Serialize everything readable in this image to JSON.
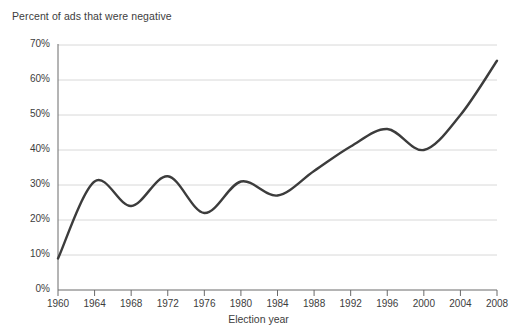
{
  "chart_data": {
    "type": "line",
    "title": "Percent of ads that were negative",
    "xlabel": "Election year",
    "ylabel": "",
    "categories": [
      1960,
      1964,
      1968,
      1972,
      1976,
      1980,
      1984,
      1988,
      1992,
      1996,
      2000,
      2004,
      2008
    ],
    "x": [
      1960,
      1964,
      1968,
      1972,
      1976,
      1980,
      1984,
      1988,
      1992,
      1996,
      2000,
      2004,
      2008
    ],
    "values": [
      9,
      31,
      24,
      32.5,
      22,
      31,
      27,
      34,
      41,
      46,
      40,
      50,
      65.5
    ],
    "series": [
      {
        "name": "Percent of ads that were negative",
        "values": [
          9,
          31,
          24,
          32.5,
          22,
          31,
          27,
          34,
          41,
          46,
          40,
          50,
          65.5
        ]
      }
    ],
    "xlim": [
      1960,
      2008
    ],
    "ylim": [
      0,
      70
    ],
    "xtick_labels": [
      "1960",
      "1964",
      "1968",
      "1972",
      "1976",
      "1980",
      "1984",
      "1988",
      "1992",
      "1996",
      "2000",
      "2004",
      "2008"
    ],
    "ytick_labels": [
      "0%",
      "10%",
      "20%",
      "30%",
      "40%",
      "50%",
      "60%",
      "70%"
    ],
    "ytick_values": [
      0,
      10,
      20,
      30,
      40,
      50,
      60,
      70
    ],
    "grid": "horizontal",
    "legend": "none",
    "line_color": "#3c3c3c",
    "grid_color": "#d8d8d8",
    "axis_color": "#6a6a6a",
    "text_color": "#3d3d3d"
  }
}
